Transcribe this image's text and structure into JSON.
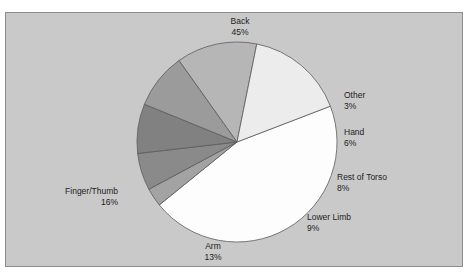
{
  "clipped_top_text": "·   ··    · ·    ·   ·",
  "panel": {
    "background_color": "#c9c9c9",
    "border_color": "#8d8d8d"
  },
  "chart_data": {
    "type": "pie",
    "title": "",
    "subtitle": "",
    "xlabel": "",
    "ylabel": "",
    "legend_position": "none",
    "grid": false,
    "labels_show_percent": true,
    "center": {
      "x": 237,
      "y": 142
    },
    "radius": 100,
    "start_angle_deg": -21,
    "direction": "clockwise",
    "categories": [
      "Back",
      "Other",
      "Hand",
      "Rest of Torso",
      "Lower Limb",
      "Arm",
      "Finger/Thumb"
    ],
    "values": [
      45,
      6,
      3,
      8,
      9,
      13,
      16
    ],
    "units": "%",
    "slices": [
      {
        "name": "Back",
        "percent": 45,
        "percent_text": "45%",
        "color": "#fdfdfd",
        "stroke": "#5c5c5c"
      },
      {
        "name": "Other",
        "percent": 3,
        "percent_text": "3%",
        "color": "#a3a3a3",
        "stroke": "#5c5c5c"
      },
      {
        "name": "Hand",
        "percent": 6,
        "percent_text": "6%",
        "color": "#8a8a8a",
        "stroke": "#5c5c5c"
      },
      {
        "name": "Rest of Torso",
        "percent": 8,
        "percent_text": "8%",
        "color": "#818181",
        "stroke": "#5c5c5c"
      },
      {
        "name": "Lower Limb",
        "percent": 9,
        "percent_text": "9%",
        "color": "#9b9b9b",
        "stroke": "#5c5c5c"
      },
      {
        "name": "Arm",
        "percent": 13,
        "percent_text": "13%",
        "color": "#b6b6b6",
        "stroke": "#5c5c5c"
      },
      {
        "name": "Finger/Thumb",
        "percent": 16,
        "percent_text": "16%",
        "color": "#ececec",
        "stroke": "#5c5c5c"
      }
    ]
  }
}
